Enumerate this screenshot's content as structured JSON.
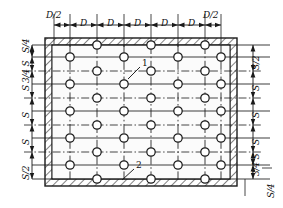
{
  "drawing": {
    "title": "Staggered hole pattern layout in rectangular plate",
    "type": "engineering-dimension-drawing",
    "colors": {
      "line": "#1a1a1a",
      "hatch": "#1a1a1a",
      "background": "#ffffff",
      "field": "#fafafa"
    },
    "plate": {
      "outer": {
        "x": 45,
        "y": 38,
        "width": 192,
        "height": 148
      },
      "wall_thickness": 7
    },
    "callouts": [
      {
        "id": "1",
        "label": "1",
        "target": "hole",
        "tip_x": 133,
        "tip_y": 73,
        "text_x": 142,
        "text_y": 64
      },
      {
        "id": "2",
        "label": "2",
        "target": "plate-wall",
        "tip_x": 125,
        "tip_y": 180,
        "text_x": 137,
        "text_y": 167
      }
    ],
    "top_dimensions": {
      "orientation": "horizontal",
      "labels": [
        "D/2",
        "D",
        "D",
        "D",
        "D",
        "D",
        "D/2"
      ],
      "tick_x": [
        54,
        70,
        97,
        124,
        151,
        178,
        205,
        221
      ],
      "baseline_y": 25
    },
    "left_dimensions": {
      "orientation": "vertical",
      "labels": [
        "S/4",
        "3/4 S",
        "S",
        "S",
        "S",
        "S/2"
      ],
      "tick_y": [
        45,
        57,
        74,
        101,
        128,
        155,
        179
      ],
      "baseline_x": 32
    },
    "right_dimensions": {
      "orientation": "vertical",
      "labels": [
        "S/2",
        "S",
        "S",
        "S",
        "3/4 S",
        "S/4"
      ],
      "tick_y": [
        45,
        68,
        95,
        122,
        149,
        167,
        179
      ],
      "baseline_x": 253
    },
    "holes": {
      "radius": 4.2,
      "columns_x": [
        70,
        97,
        124,
        151,
        178,
        205,
        221
      ],
      "odd_column_rows_y": [
        57,
        84,
        111,
        138,
        165
      ],
      "even_column_rows_y": [
        45,
        71,
        98,
        125,
        152,
        179
      ],
      "odd_columns_index": [
        0,
        2,
        4,
        6
      ],
      "even_columns_index": [
        1,
        3,
        5
      ],
      "note": "Odd columns carry 5 holes aligned to dimension stations; even columns carry 6 staggered holes"
    }
  }
}
